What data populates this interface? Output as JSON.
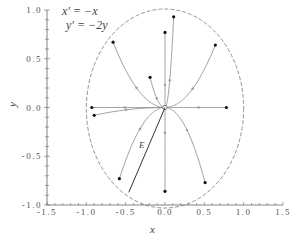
{
  "chart_data": {
    "type": "line",
    "title": "",
    "equations": [
      "x′ = −x",
      "y′ = −2y"
    ],
    "xlabel": "x",
    "ylabel": "y",
    "xlim": [
      -1.5,
      1.5
    ],
    "ylim": [
      -1.0,
      1.0
    ],
    "grid": false,
    "x_ticks": [
      "-1.5",
      "-1.0",
      "-0.5",
      "0.0",
      "0.5",
      "1.0",
      "1.5"
    ],
    "y_ticks": [
      "-1.0",
      "-0.5",
      "0.0",
      "0.5",
      "1.0"
    ],
    "x_tick_values": [
      -1.5,
      -1.0,
      -0.5,
      0.0,
      0.5,
      1.0,
      1.5
    ],
    "y_tick_values": [
      -1.0,
      -0.5,
      0.0,
      0.5,
      1.0
    ],
    "equilibrium": {
      "x": 0.0,
      "y": 0.0,
      "type": "stable node"
    },
    "boundary_ellipse": {
      "cx": 0.0,
      "cy": 0.0,
      "rx": 1.0,
      "ry": 1.0,
      "style": "dashed"
    },
    "trajectories": [
      {
        "x0": 0.11,
        "y0": 0.93
      },
      {
        "x0": 0.0,
        "y0": 0.77
      },
      {
        "x0": -0.66,
        "y0": 0.67
      },
      {
        "x0": 0.64,
        "y0": 0.64
      },
      {
        "x0": -0.19,
        "y0": 0.31
      },
      {
        "x0": -0.93,
        "y0": 0.0
      },
      {
        "x0": -0.9,
        "y0": -0.08
      },
      {
        "x0": 0.78,
        "y0": 0.0
      },
      {
        "x0": -0.58,
        "y0": -0.73
      },
      {
        "x0": 0.0,
        "y0": -0.86
      },
      {
        "x0": 0.51,
        "y0": -0.77
      }
    ],
    "annotation_line": {
      "label": "E",
      "from": [
        0.0,
        0.0
      ],
      "to": [
        -0.46,
        -0.87
      ]
    }
  }
}
